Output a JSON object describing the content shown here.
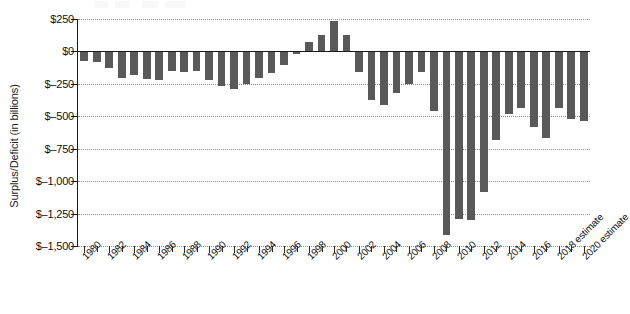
{
  "chart_data": {
    "type": "bar",
    "title": "",
    "subtitle": "",
    "xlabel": "",
    "ylabel": "Surplus/Deficit (in billions)",
    "ylim": [
      -1500,
      250
    ],
    "ytick_values": [
      250,
      0,
      -250,
      -500,
      -750,
      -1000,
      -1250,
      -1500
    ],
    "ytick_labels": [
      "$250",
      "$0",
      "$–250",
      "$–500",
      "$–750",
      "$–1,000",
      "$–1,250",
      "$–1,500"
    ],
    "grid": true,
    "legend": "none",
    "bar_color": "#595959",
    "axis_color": "#1a1a1a",
    "gridline_color": "#8c8c8c",
    "categories": [
      "1980",
      "1981",
      "1982",
      "1983",
      "1984",
      "1985",
      "1986",
      "1987",
      "1988",
      "1989",
      "1990",
      "1991",
      "1992",
      "1993",
      "1994",
      "1995",
      "1996",
      "1997",
      "1998",
      "1999",
      "2000",
      "2001",
      "2002",
      "2003",
      "2004",
      "2005",
      "2006",
      "2007",
      "2008",
      "2009",
      "2010",
      "2011",
      "2012",
      "2013",
      "2014",
      "2015",
      "2016",
      "2017",
      "2018 estimate",
      "2019 estimate",
      "2020 estimate"
    ],
    "visible_tick_labels": [
      "1980",
      "1982",
      "1984",
      "1986",
      "1988",
      "1990",
      "1992",
      "1994",
      "1996",
      "1998",
      "2000",
      "2002",
      "2004",
      "2006",
      "2008",
      "2010",
      "2012",
      "2014",
      "2016",
      "2018 estimate",
      "2020 estimate"
    ],
    "values": [
      -74,
      -79,
      -128,
      -208,
      -185,
      -212,
      -221,
      -150,
      -155,
      -153,
      -221,
      -269,
      -290,
      -255,
      -203,
      -164,
      -107,
      -22,
      69,
      126,
      236,
      128,
      -158,
      -378,
      -413,
      -318,
      -248,
      -161,
      -459,
      -1413,
      -1294,
      -1300,
      -1087,
      -680,
      -485,
      -438,
      -585,
      -665,
      -440,
      -520,
      -540
    ]
  }
}
